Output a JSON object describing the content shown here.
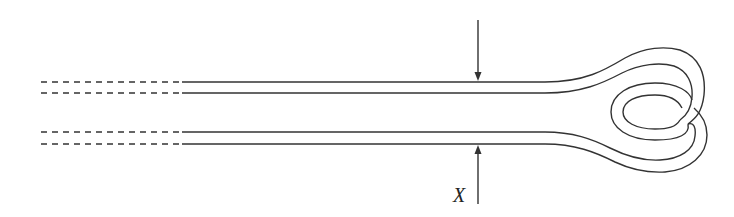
{
  "diagram": {
    "labels": {
      "dimension": "X"
    },
    "colors": {
      "stroke": "#333333",
      "background": "#ffffff"
    },
    "elements": [
      {
        "name": "upper-tube",
        "style": "double line, dashed then solid"
      },
      {
        "name": "lower-tube",
        "style": "double line, dashed then solid"
      },
      {
        "name": "loop-end",
        "style": "coiled double-line loop"
      },
      {
        "name": "top-arrow",
        "direction": "down"
      },
      {
        "name": "bottom-arrow",
        "direction": "up"
      }
    ]
  }
}
